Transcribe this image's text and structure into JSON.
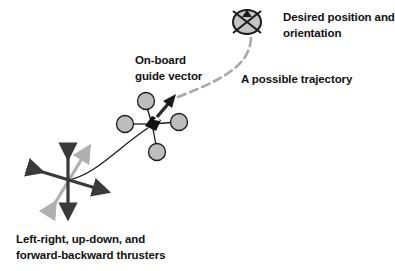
{
  "diagram": {
    "labels": {
      "desired_line1": "Desired position and",
      "desired_line2": "orientation",
      "guide_line1": "On-board",
      "guide_line2": "guide vector",
      "trajectory": "A possible trajectory",
      "thrusters_line1": "Left-right, up-down, and",
      "thrusters_line2": "forward-backward thrusters"
    },
    "nodes": [
      {
        "id": "target",
        "label": "Desired position and orientation",
        "shape": "crossed-ellipse"
      },
      {
        "id": "robot",
        "label": "On-board guide vector",
        "shape": "quad-rotor"
      },
      {
        "id": "thrusters",
        "label": "Left-right, up-down, and forward-backward thrusters",
        "shape": "3-axis-arrows"
      }
    ],
    "edges": [
      {
        "from": "robot",
        "to": "target",
        "style": "dashed",
        "label": "A possible trajectory"
      },
      {
        "from": "thrusters",
        "to": "robot",
        "style": "solid-curve"
      }
    ],
    "colors": {
      "dark": "#3a3a3a",
      "light_gray": "#b0b0b0",
      "rotor_fill": "#bdbdbd",
      "dash": "#a8a8a8",
      "text": "#111111"
    }
  }
}
